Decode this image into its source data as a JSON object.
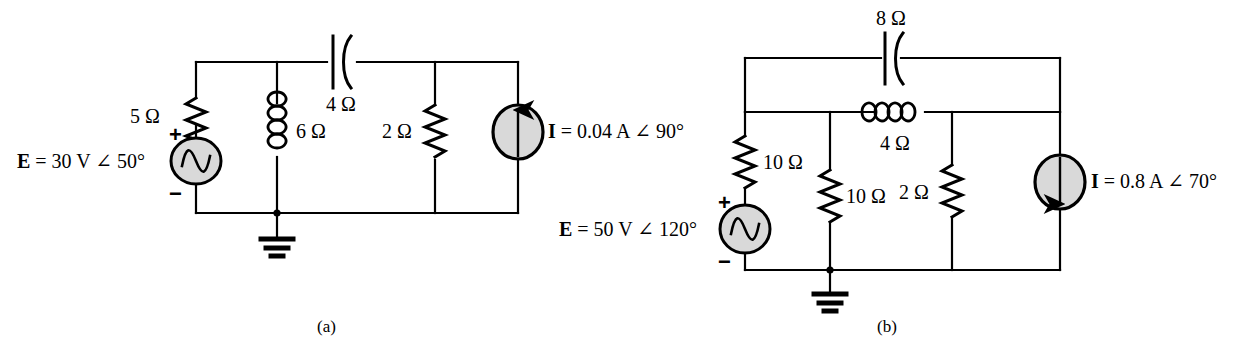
{
  "figure": {
    "background_color": "#ffffff",
    "line_color": "#000000",
    "source_fill_color": "#d9d9d9"
  },
  "circuits": [
    {
      "id": "a",
      "caption": "(a)",
      "voltage_source": {
        "label": "E  =  30 V ∠ 50°",
        "symbol": "ac-sine",
        "plus_sign": "+",
        "minus_sign": "−"
      },
      "current_source": {
        "label": "I  =  0.04 A ∠ 90°",
        "symbol": "current-arrow",
        "arrow_direction": "up"
      },
      "components": [
        {
          "name": "resistor-5-ohm",
          "type": "resistor",
          "value": "5 Ω",
          "orientation": "vertical"
        },
        {
          "name": "inductor-6-ohm",
          "type": "inductor",
          "value": "6 Ω",
          "orientation": "vertical"
        },
        {
          "name": "capacitor-4-ohm",
          "type": "capacitor",
          "value": "4 Ω",
          "orientation": "horizontal"
        },
        {
          "name": "resistor-2-ohm",
          "type": "resistor",
          "value": "2 Ω",
          "orientation": "vertical"
        }
      ],
      "ground": {
        "name": "ground-symbol",
        "type": "earth-ground"
      }
    },
    {
      "id": "b",
      "caption": "(b)",
      "voltage_source": {
        "label": "E  =  50 V ∠ 120°",
        "symbol": "ac-sine",
        "plus_sign": "+",
        "minus_sign": "−"
      },
      "current_source": {
        "label": "I  =  0.8 A ∠ 70°",
        "symbol": "current-arrow",
        "arrow_direction": "down"
      },
      "components": [
        {
          "name": "capacitor-8-ohm",
          "type": "capacitor",
          "value": "8 Ω",
          "orientation": "horizontal"
        },
        {
          "name": "inductor-4-ohm",
          "type": "inductor",
          "value": "4 Ω",
          "orientation": "horizontal"
        },
        {
          "name": "resistor-10-ohm-left",
          "type": "resistor",
          "value": "10 Ω",
          "orientation": "vertical"
        },
        {
          "name": "resistor-10-ohm-middle",
          "type": "resistor",
          "value": "10 Ω",
          "orientation": "vertical"
        },
        {
          "name": "resistor-2-ohm",
          "type": "resistor",
          "value": "2 Ω",
          "orientation": "vertical"
        }
      ],
      "ground": {
        "name": "ground-symbol",
        "type": "earth-ground"
      }
    }
  ],
  "labels": {
    "a_res5": "5 Ω",
    "a_ind6": "6 Ω",
    "a_cap4": "4 Ω",
    "a_res2": "2 Ω",
    "a_source": "E  =  30 V ∠ 50°",
    "a_current": "I  =  0.04 A ∠ 90°",
    "a_plus": "+",
    "a_minus": "−",
    "a_caption": "(a)",
    "b_cap8": "8 Ω",
    "b_ind4": "4 Ω",
    "b_res10_left": "10 Ω",
    "b_res10_mid": "10 Ω",
    "b_res2": "2 Ω",
    "b_source": "E  =  50 V ∠ 120°",
    "b_current": "I  =  0.8 A ∠ 70°",
    "b_plus": "+",
    "b_minus": "−",
    "b_caption": "(b)"
  }
}
